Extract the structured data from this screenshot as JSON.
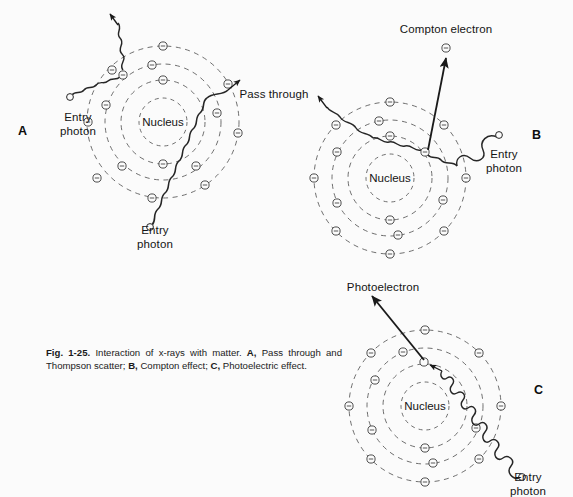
{
  "figure": {
    "number": "Fig. 1-25.",
    "caption_body": " Interaction of x-rays with matter. ",
    "caption_parts": {
      "a_letter": "A,",
      "a_text": " Pass through and Thompson scatter; ",
      "b_letter": "B,",
      "b_text": " Compton effect; ",
      "c_letter": "C,",
      "c_text": " Photoelectric effect."
    }
  },
  "panels": {
    "a": {
      "letter": "A",
      "nucleus_label": "Nucleus",
      "entry_photon_left": "Entry\nphoton",
      "entry_photon_bottom": "Entry\nphoton",
      "pass_through_label": "Pass through",
      "shell_count": 4,
      "shell_radii": [
        24,
        42,
        58,
        76
      ],
      "center": [
        163,
        122
      ],
      "electron_glyph": "electron-minus",
      "process": "Pass through and Thompson scatter"
    },
    "b": {
      "letter": "B",
      "nucleus_label": "Nucleus",
      "entry_photon": "Entry\nphoton",
      "compton_electron_label": "Compton electron",
      "shell_count": 4,
      "shell_radii": [
        24,
        42,
        58,
        76
      ],
      "center": [
        390,
        178
      ],
      "electron_glyph": "electron-minus",
      "process": "Compton effect"
    },
    "c": {
      "letter": "C",
      "nucleus_label": "Nucleus",
      "entry_photon": "Entry\nphoton",
      "photoelectron_label": "Photoelectron",
      "shell_count": 4,
      "shell_radii": [
        24,
        42,
        58,
        76
      ],
      "center": [
        425,
        406
      ],
      "electron_glyph": "electron-minus",
      "process": "Photoelectric effect"
    }
  },
  "colors": {
    "background": "#fbfbfb",
    "ink": "#1a1a1a",
    "shell_line": "#555555",
    "electron_line": "#3a3a3a"
  }
}
